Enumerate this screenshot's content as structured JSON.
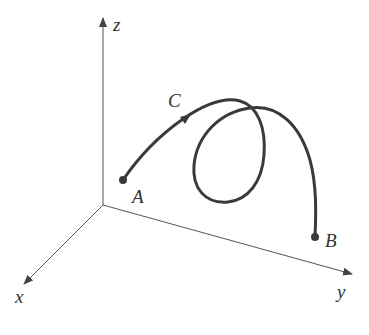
{
  "diagram": {
    "type": "3d-space-curve",
    "axes": {
      "x": {
        "label": "x"
      },
      "y": {
        "label": "y"
      },
      "z": {
        "label": "z"
      }
    },
    "curve": {
      "label": "C",
      "direction": "A to B"
    },
    "points": {
      "start": {
        "label": "A"
      },
      "end": {
        "label": "B"
      }
    },
    "colors": {
      "axis": "#555555",
      "curve": "#3a3a3a",
      "text": "#333333",
      "background": "#ffffff"
    }
  }
}
